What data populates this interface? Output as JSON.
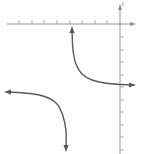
{
  "chart_data": {
    "type": "line",
    "title": "",
    "xlabel": "x",
    "ylabel": "y",
    "x_ticks_count": 8,
    "y_ticks_count": 10,
    "grid": false,
    "legend": null,
    "series": [
      {
        "name": "upper-right-branch",
        "points_px": [
          [
            72,
            30
          ],
          [
            73,
            50
          ],
          [
            76,
            64
          ],
          [
            82,
            74
          ],
          [
            92,
            80
          ],
          [
            108,
            83.5
          ],
          [
            132,
            85
          ]
        ],
        "end_arrows": [
          "up",
          "right"
        ]
      },
      {
        "name": "lower-left-branch",
        "points_px": [
          [
            8,
            92
          ],
          [
            30,
            93.5
          ],
          [
            46,
            97
          ],
          [
            57,
            104
          ],
          [
            63,
            116
          ],
          [
            66,
            131
          ],
          [
            66,
            148
          ]
        ],
        "end_arrows": [
          "left",
          "down"
        ]
      }
    ],
    "axes_px": {
      "x_axis_y": 24,
      "x_axis_range": [
        7,
        136
      ],
      "y_axis_x": 120,
      "y_axis_range": [
        4,
        154
      ],
      "x_tick_positions": [
        19,
        32,
        44,
        57,
        70,
        82,
        95,
        107
      ],
      "y_tick_positions": [
        37,
        50,
        62,
        75,
        87,
        100,
        112,
        125,
        137,
        150
      ]
    }
  }
}
